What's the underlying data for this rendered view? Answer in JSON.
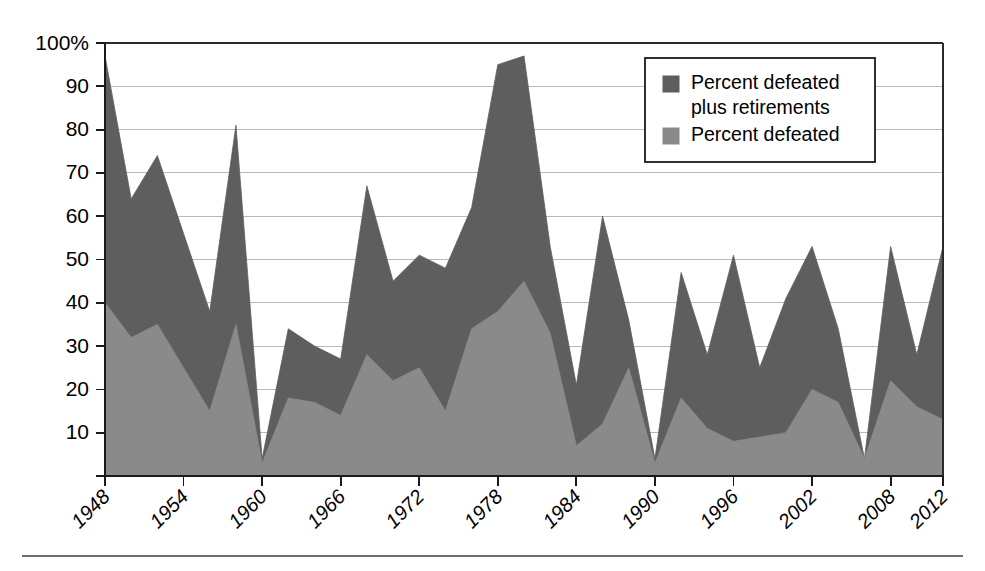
{
  "chart_data": {
    "type": "area",
    "title": "",
    "subtitle": "",
    "xlabel": "",
    "ylabel": "",
    "ylim": [
      0,
      100
    ],
    "xlim": [
      1948,
      2012
    ],
    "grid": true,
    "y_ticks": [
      10,
      20,
      30,
      40,
      50,
      60,
      70,
      80,
      90,
      100
    ],
    "y_tick_labels": [
      "10",
      "20",
      "30",
      "40",
      "50",
      "60",
      "70",
      "80",
      "90",
      "100%"
    ],
    "x_ticks": [
      1948,
      1954,
      1960,
      1966,
      1972,
      1978,
      1984,
      1990,
      1996,
      2002,
      2008,
      2012
    ],
    "x_tick_labels": [
      "1948",
      "1954",
      "1960",
      "1966",
      "1972",
      "1978",
      "1984",
      "1990",
      "1996",
      "2002",
      "2008",
      "2012"
    ],
    "x": [
      1948,
      1950,
      1952,
      1954,
      1956,
      1958,
      1960,
      1962,
      1964,
      1966,
      1968,
      1970,
      1972,
      1974,
      1976,
      1978,
      1980,
      1982,
      1984,
      1986,
      1988,
      1990,
      1992,
      1994,
      1996,
      1998,
      2000,
      2002,
      2004,
      2006,
      2008,
      2010,
      2012
    ],
    "legend_position": "top-right",
    "series": [
      {
        "name": "Percent defeated plus retirements",
        "color": "#5e5e5e",
        "values": [
          97,
          64,
          74,
          56,
          38,
          81,
          4,
          34,
          30,
          27,
          67,
          45,
          51,
          48,
          62,
          95,
          97,
          53,
          21,
          60,
          36,
          4,
          47,
          28,
          51,
          25,
          41,
          53,
          34,
          4,
          53,
          28,
          53
        ]
      },
      {
        "name": "Percent defeated",
        "color": "#8a8a8a",
        "values": [
          40,
          32,
          35,
          25,
          15,
          35,
          3,
          18,
          17,
          14,
          28,
          22,
          25,
          15,
          34,
          38,
          45,
          33,
          7,
          12,
          25,
          3,
          18,
          11,
          8,
          9,
          10,
          20,
          17,
          4,
          22,
          16,
          13
        ]
      }
    ],
    "legend_entries": [
      {
        "label_line1": "Percent defeated",
        "label_line2": "plus retirements",
        "color": "#5e5e5e"
      },
      {
        "label_line1": "Percent defeated",
        "label_line2": "",
        "color": "#8a8a8a"
      }
    ]
  },
  "figure": {
    "plot": {
      "left": 105,
      "right": 943,
      "top": 43,
      "bottom": 476
    },
    "legend": {
      "x": 645,
      "y": 58,
      "width": 230,
      "height": 104
    },
    "bottom_rule": {
      "x1": 22,
      "x2": 963,
      "y": 556
    }
  }
}
